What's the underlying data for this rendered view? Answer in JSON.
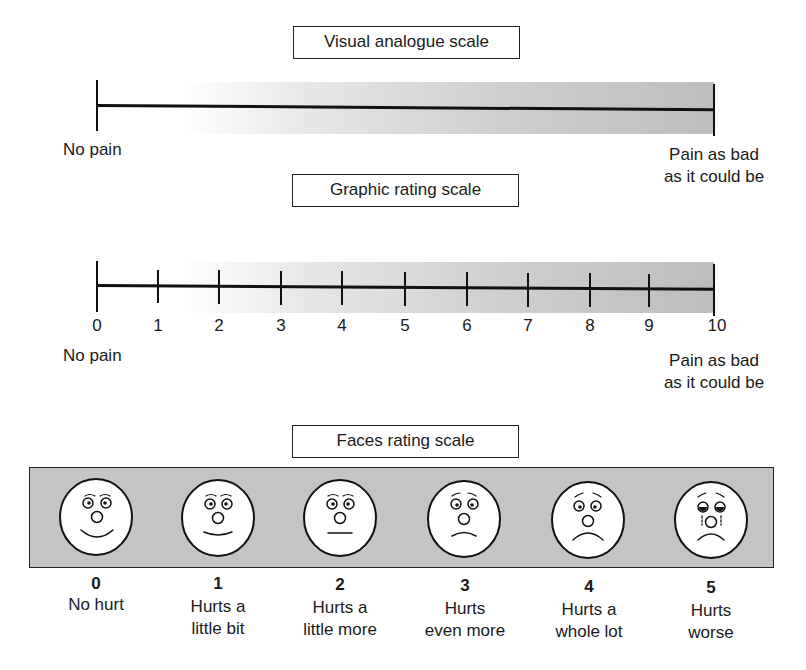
{
  "visual_analogue": {
    "title": "Visual analogue scale",
    "left_label": "No pain",
    "right_label_line1": "Pain as bad",
    "right_label_line2": "as it could be"
  },
  "graphic_rating": {
    "title": "Graphic rating scale",
    "ticks": [
      "0",
      "1",
      "2",
      "3",
      "4",
      "5",
      "6",
      "7",
      "8",
      "9",
      "10"
    ],
    "left_label": "No pain",
    "right_label_line1": "Pain as bad",
    "right_label_line2": "as it could be"
  },
  "faces_rating": {
    "title": "Faces rating scale",
    "faces": [
      {
        "value": "0",
        "line1": "No hurt",
        "line2": "",
        "expression": "big-smile"
      },
      {
        "value": "1",
        "line1": "Hurts a",
        "line2": "little bit",
        "expression": "slight-smile"
      },
      {
        "value": "2",
        "line1": "Hurts a",
        "line2": "little more",
        "expression": "neutral"
      },
      {
        "value": "3",
        "line1": "Hurts",
        "line2": "even more",
        "expression": "slight-frown"
      },
      {
        "value": "4",
        "line1": "Hurts a",
        "line2": "whole lot",
        "expression": "frown"
      },
      {
        "value": "5",
        "line1": "Hurts",
        "line2": "worse",
        "expression": "crying"
      }
    ]
  },
  "colors": {
    "panel_gray": "#c4c4c4",
    "line": "#111111",
    "gradient_end": "#bdbdbd"
  }
}
